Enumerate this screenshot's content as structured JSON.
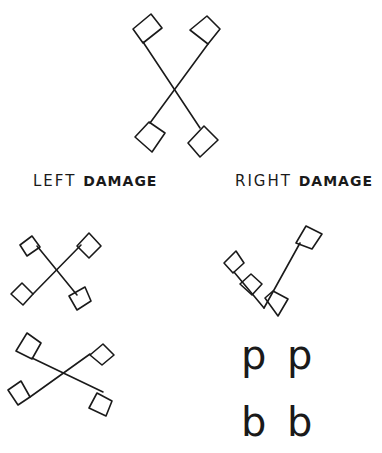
{
  "labels": {
    "left": {
      "word1": "LEFT",
      "word2": "DAMAGE"
    },
    "right": {
      "word1": "RIGHT",
      "word2": "DAMAGE"
    }
  },
  "letters": {
    "row1": [
      "p",
      "p"
    ],
    "row2": [
      "b",
      "b"
    ]
  },
  "colors": {
    "ink": "#1a1a1a",
    "paper": "#ffffff"
  }
}
